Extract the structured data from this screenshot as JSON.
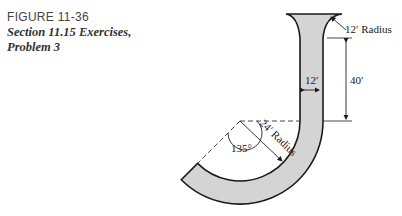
{
  "caption": {
    "figure_number": "FIGURE 11-36",
    "title_line1": "Section 11.15 Exercises,",
    "title_line2": "Problem 3"
  },
  "diagram": {
    "labels": {
      "top_radius": "12′ Radius",
      "width": "12′",
      "height": "40′",
      "angle": "135°",
      "bend_radius": "24′ Radius"
    },
    "colors": {
      "fill": "#d4d4d4",
      "stroke": "#1a1a1a"
    }
  }
}
